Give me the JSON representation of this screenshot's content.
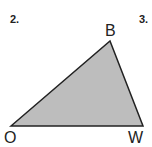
{
  "problem_numbers": {
    "left": "2.",
    "right": "3."
  },
  "triangle": {
    "vertices": [
      {
        "label": "O",
        "x": 11,
        "y": 126
      },
      {
        "label": "B",
        "x": 110,
        "y": 41
      },
      {
        "label": "W",
        "x": 143,
        "y": 126
      }
    ],
    "fill": "#bdbdbd",
    "stroke": "#222222"
  }
}
